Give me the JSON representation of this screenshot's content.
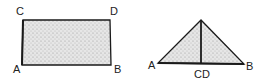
{
  "figures": [
    {
      "name": "rectangle",
      "labels": {
        "top_left": "C",
        "top_right": "D",
        "bottom_left": "A",
        "bottom_right": "B"
      }
    },
    {
      "name": "triangle",
      "labels": {
        "left": "A",
        "right": "B",
        "bottom_center": "CD"
      }
    }
  ],
  "colors": {
    "stroke": "#1a1a1a",
    "fill": "#dcdcdc",
    "text": "#222222"
  }
}
